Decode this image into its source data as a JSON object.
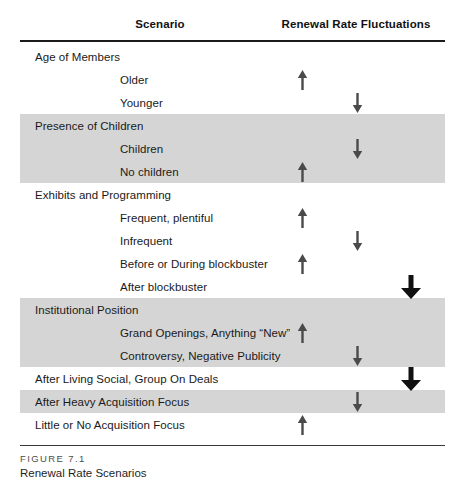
{
  "figure": {
    "label": "FIGURE 7.1",
    "title": "Renewal Rate Scenarios"
  },
  "colors": {
    "shade": "#d5d5d5",
    "rule": "#1b1b1b",
    "arrow_small": "#4a4a4a",
    "arrow_large": "#111111"
  },
  "columns": {
    "scenario": "Scenario",
    "renewal": "Renewal Rate Fluctuations"
  },
  "rows": [
    {
      "label": "Age of Members",
      "level": 0,
      "shaded": false,
      "arrow": null,
      "column": null
    },
    {
      "label": "Older",
      "level": 1,
      "shaded": false,
      "arrow": "up",
      "column": "col-up"
    },
    {
      "label": "Younger",
      "level": 1,
      "shaded": false,
      "arrow": "down",
      "column": "col-down"
    },
    {
      "label": "Presence of Children",
      "level": 0,
      "shaded": true,
      "arrow": null,
      "column": null
    },
    {
      "label": "Children",
      "level": 1,
      "shaded": true,
      "arrow": "down",
      "column": "col-down"
    },
    {
      "label": "No children",
      "level": 1,
      "shaded": true,
      "arrow": "up",
      "column": "col-up"
    },
    {
      "label": "Exhibits and Programming",
      "level": 0,
      "shaded": false,
      "arrow": null,
      "column": null
    },
    {
      "label": "Frequent, plentiful",
      "level": 1,
      "shaded": false,
      "arrow": "up",
      "column": "col-up"
    },
    {
      "label": "Infrequent",
      "level": 1,
      "shaded": false,
      "arrow": "down",
      "column": "col-down"
    },
    {
      "label": "Before or During blockbuster",
      "level": 1,
      "shaded": false,
      "arrow": "up",
      "column": "col-up"
    },
    {
      "label": "After blockbuster",
      "level": 1,
      "shaded": false,
      "arrow": "down-large",
      "column": "col-big"
    },
    {
      "label": "Institutional Position",
      "level": 0,
      "shaded": true,
      "arrow": null,
      "column": null
    },
    {
      "label": "Grand Openings, Anything “New”",
      "level": 1,
      "shaded": true,
      "arrow": "up",
      "column": "col-up"
    },
    {
      "label": "Controversy, Negative Publicity",
      "level": 1,
      "shaded": true,
      "arrow": "down",
      "column": "col-down"
    },
    {
      "label": "After Living Social, Group On Deals",
      "level": 0,
      "shaded": false,
      "arrow": "down-large",
      "column": "col-big"
    },
    {
      "label": "After Heavy Acquisition Focus",
      "level": 0,
      "shaded": true,
      "arrow": "down",
      "column": "col-down"
    },
    {
      "label": "Little or No Acquisition Focus",
      "level": 0,
      "shaded": false,
      "arrow": "up",
      "column": "col-up"
    }
  ]
}
